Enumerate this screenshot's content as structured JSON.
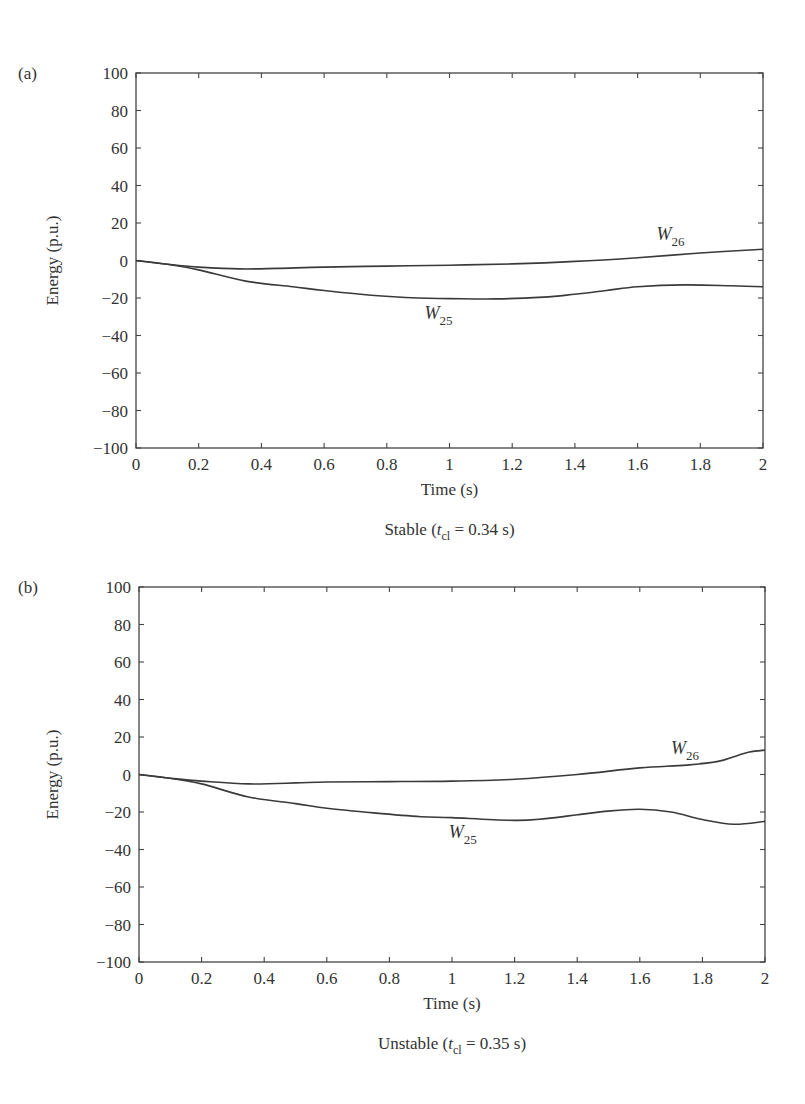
{
  "chart_data": [
    {
      "panel": "(a)",
      "type": "line",
      "title": "",
      "caption": {
        "prefix": "Stable (",
        "var": "t",
        "sub": "cl",
        "suffix": " = 0.34 s)"
      },
      "xlabel": "Time (s)",
      "ylabel": "Energy (p.u.)",
      "xlim": [
        0,
        2
      ],
      "ylim": [
        -100,
        100
      ],
      "xticks": [
        "0",
        "0.2",
        "0.4",
        "0.6",
        "0.8",
        "1",
        "1.2",
        "1.4",
        "1.6",
        "1.8",
        "2"
      ],
      "yticks": [
        "100",
        "80",
        "60",
        "40",
        "20",
        "0",
        "−20",
        "−40",
        "−60",
        "−80",
        "−100"
      ],
      "grid": false,
      "legend": "inline labels",
      "series": [
        {
          "name": "W26",
          "label_main": "W",
          "label_sub": "26",
          "label_pos": {
            "x": 1.66,
            "y": 11
          },
          "x": [
            0,
            0.1,
            0.2,
            0.33,
            0.45,
            0.6,
            0.8,
            1.0,
            1.2,
            1.4,
            1.6,
            1.8,
            2.0
          ],
          "y": [
            0,
            -2,
            -3.5,
            -4.5,
            -4.2,
            -3.5,
            -3,
            -2.5,
            -1.8,
            -0.5,
            1.5,
            4,
            6
          ]
        },
        {
          "name": "W25",
          "label_main": "W",
          "label_sub": "25",
          "label_pos": {
            "x": 0.92,
            "y": -31
          },
          "x": [
            0,
            0.1,
            0.2,
            0.35,
            0.5,
            0.6,
            0.75,
            0.9,
            1.0,
            1.15,
            1.3,
            1.4,
            1.5,
            1.6,
            1.75,
            1.9,
            2.0
          ],
          "y": [
            0,
            -2,
            -5,
            -11,
            -14,
            -16,
            -18.5,
            -20,
            -20.3,
            -20.5,
            -19.5,
            -18,
            -16,
            -14,
            -13,
            -13.5,
            -14
          ]
        }
      ]
    },
    {
      "panel": "(b)",
      "type": "line",
      "title": "",
      "caption": {
        "prefix": "Unstable (",
        "var": "t",
        "sub": "cl",
        "suffix": " = 0.35 s)"
      },
      "xlabel": "Time (s)",
      "ylabel": "Energy (p.u.)",
      "xlim": [
        0,
        2
      ],
      "ylim": [
        -100,
        100
      ],
      "xticks": [
        "0",
        "0.2",
        "0.4",
        "0.6",
        "0.8",
        "1",
        "1.2",
        "1.4",
        "1.6",
        "1.8",
        "2"
      ],
      "yticks": [
        "100",
        "80",
        "60",
        "40",
        "20",
        "0",
        "−20",
        "−40",
        "−60",
        "−80",
        "−100"
      ],
      "grid": false,
      "legend": "inline labels",
      "series": [
        {
          "name": "W26",
          "label_main": "W",
          "label_sub": "26",
          "label_pos": {
            "x": 1.7,
            "y": 11
          },
          "x": [
            0,
            0.1,
            0.2,
            0.35,
            0.5,
            0.6,
            0.8,
            1.0,
            1.2,
            1.4,
            1.6,
            1.75,
            1.85,
            1.9,
            1.95,
            2.0
          ],
          "y": [
            0,
            -2,
            -3.5,
            -5,
            -4.5,
            -4,
            -3.8,
            -3.5,
            -2.5,
            0,
            3.5,
            5,
            7,
            9.5,
            12,
            13
          ]
        },
        {
          "name": "W25",
          "label_main": "W",
          "label_sub": "25",
          "label_pos": {
            "x": 0.99,
            "y": -34
          },
          "x": [
            0,
            0.1,
            0.2,
            0.35,
            0.5,
            0.6,
            0.75,
            0.9,
            1.0,
            1.2,
            1.3,
            1.4,
            1.5,
            1.6,
            1.7,
            1.8,
            1.9,
            2.0
          ],
          "y": [
            0,
            -2,
            -5,
            -12,
            -15.5,
            -18,
            -20.5,
            -22.5,
            -23,
            -24.5,
            -23.5,
            -21.5,
            -19.5,
            -18.5,
            -20,
            -24,
            -26.5,
            -25
          ]
        }
      ]
    }
  ]
}
